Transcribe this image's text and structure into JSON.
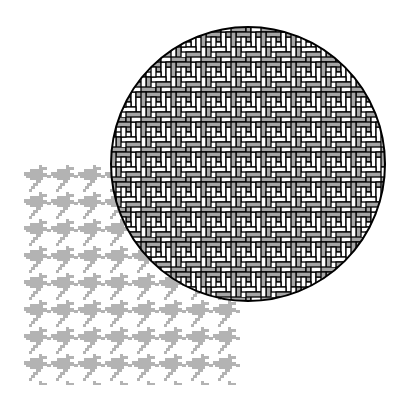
{
  "figure": {
    "background": "#ffffff",
    "houndstooth": {
      "color": "#b3b3b3",
      "region": {
        "x": 24,
        "y": 165,
        "width": 216,
        "height": 220
      },
      "period": 27
    },
    "herringbone_circle": {
      "cx": 248,
      "cy": 164,
      "r": 137,
      "brick_fill_gray": "#a6a6a6",
      "brick_fill_white": "#ffffff",
      "outline": "#000000"
    }
  }
}
